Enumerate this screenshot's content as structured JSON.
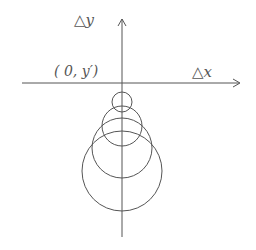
{
  "diagram": {
    "axes": {
      "x_label": "△x",
      "y_label": "△y",
      "origin_label": "( 0, y′)"
    },
    "colors": {
      "stroke": "#555555",
      "text": "#555555",
      "background": "#ffffff"
    },
    "circles": [
      {
        "name": "circle-1",
        "cx": 122,
        "cy": 102,
        "r": 10
      },
      {
        "name": "circle-2",
        "cx": 122,
        "cy": 126,
        "r": 20
      },
      {
        "name": "circle-3",
        "cx": 122,
        "cy": 148,
        "r": 30
      },
      {
        "name": "circle-4",
        "cx": 122,
        "cy": 171,
        "r": 40
      }
    ]
  }
}
